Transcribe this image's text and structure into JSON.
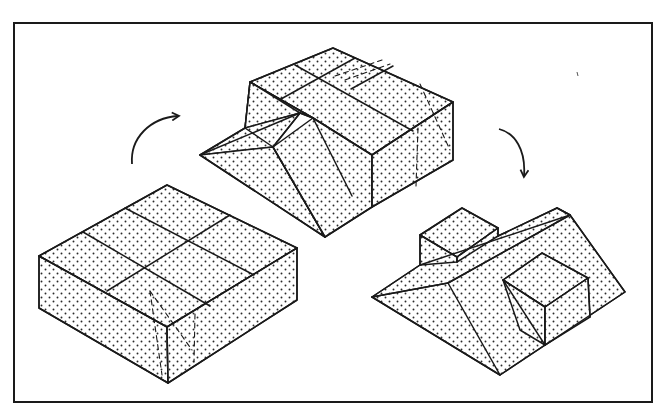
{
  "figure": {
    "frame": {
      "x": 14,
      "y": 23,
      "width": 638,
      "height": 379
    },
    "colors": {
      "line": "#1a1a1a",
      "background": "#ffffff",
      "stipple": "#2a2a2a"
    },
    "arrows": [
      {
        "id": "arrow-left-to-middle",
        "direction": "clockwise",
        "from": "left-block",
        "to": "middle-block"
      },
      {
        "id": "arrow-middle-to-right",
        "direction": "clockwise",
        "from": "middle-block",
        "to": "right-block"
      }
    ],
    "blocks": [
      {
        "id": "left-block",
        "label": "rectangular block divided into six top cells"
      },
      {
        "id": "middle-block",
        "label": "block with one sloped wedge cut"
      },
      {
        "id": "right-block",
        "label": "block with sloped ridge, raised small block and square block"
      }
    ]
  }
}
